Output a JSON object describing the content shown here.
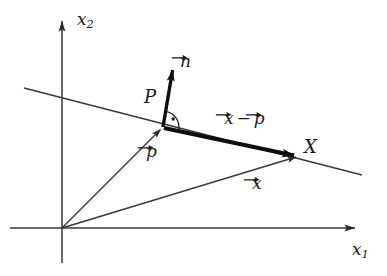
{
  "figure": {
    "background_color": "#ffffff",
    "line_color": "#2b2b2b",
    "emphasis_color": "#0d0d0d",
    "width": 387,
    "height": 276
  },
  "axes": {
    "x_label": "x",
    "x_subscript": "1",
    "y_label": "x",
    "y_subscript": "2",
    "origin": {
      "x": 62,
      "y": 228
    },
    "x_axis_tip": {
      "x": 362,
      "y": 228
    },
    "y_axis_tip": {
      "x": 62,
      "y": 14
    }
  },
  "points": {
    "P": {
      "label": "P",
      "description": "foot of perpendicular on the plane",
      "x": 163,
      "y": 127
    },
    "X": {
      "label": "X",
      "description": "point off the plane",
      "x": 300,
      "y": 156
    }
  },
  "vectors": {
    "normal": {
      "label": "n",
      "accent": "arrow",
      "from": {
        "x": 163,
        "y": 127
      },
      "to": {
        "x": 174,
        "y": 62
      }
    },
    "p": {
      "label": "p",
      "accent": "arrow",
      "from": {
        "x": 62,
        "y": 228
      },
      "to": {
        "x": 163,
        "y": 127
      }
    },
    "x": {
      "label": "x",
      "accent": "arrow",
      "from": {
        "x": 62,
        "y": 228
      },
      "to": {
        "x": 300,
        "y": 156
      }
    },
    "x_minus_p": {
      "label_first": "x",
      "operator": "−",
      "label_second": "p",
      "accent": "arrow",
      "from": {
        "x": 163,
        "y": 127
      },
      "to": {
        "x": 300,
        "y": 156
      },
      "emphasis": "thick"
    }
  },
  "plane_line": {
    "name": "plane-edge-line",
    "from": {
      "x": 24,
      "y": 88
    },
    "to": {
      "x": 362,
      "y": 175
    }
  },
  "right_angle_marker": {
    "name": "right-angle-arc",
    "at": {
      "x": 163,
      "y": 127
    },
    "radius": 15,
    "dot": true
  },
  "labels": {
    "y_axis": {
      "left": 77,
      "top": 11
    },
    "x_axis": {
      "left": 352,
      "top": 241
    },
    "P": {
      "left": 144,
      "top": 88
    },
    "X": {
      "left": 304,
      "top": 138
    },
    "n": {
      "left": 180,
      "top": 53
    },
    "p": {
      "left": 146,
      "top": 143
    },
    "x": {
      "left": 252,
      "top": 175
    },
    "x_minus_p": {
      "left": 224,
      "top": 110
    }
  }
}
